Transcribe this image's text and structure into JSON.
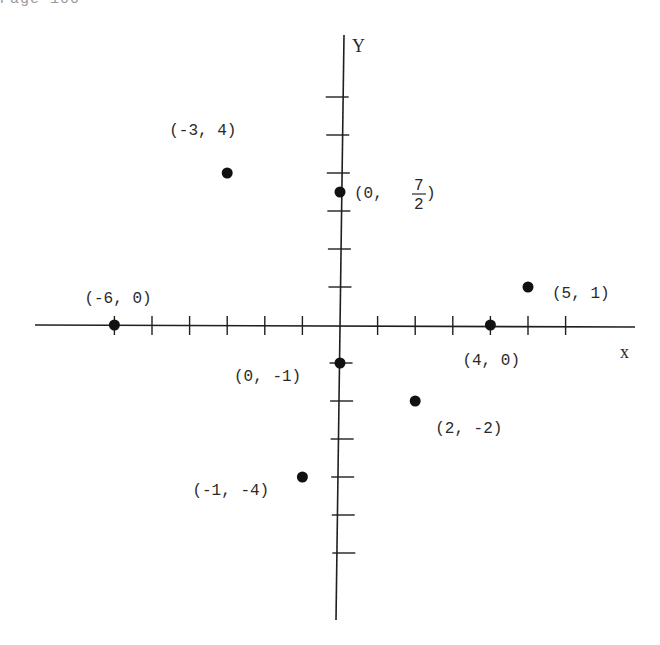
{
  "header": {
    "partial_text": "Page 100"
  },
  "chart_data": {
    "type": "scatter",
    "title": "",
    "xlabel": "x",
    "ylabel": "Y",
    "xlim": [
      -8,
      8
    ],
    "ylim": [
      -8,
      8
    ],
    "grid": false,
    "x_ticks": [
      -6,
      -5,
      -4,
      -3,
      -2,
      -1,
      1,
      2,
      3,
      4,
      5,
      6
    ],
    "y_ticks": [
      -6,
      -5,
      -4,
      -3,
      -2,
      -1,
      1,
      2,
      3,
      4,
      5,
      6
    ],
    "points": [
      {
        "x": -3,
        "y": 4,
        "label": "(-3, 4)"
      },
      {
        "x": 0,
        "y": 3.5,
        "label": "(0, 7/2)",
        "label_parts": {
          "prefix": "(0, ",
          "num": "7",
          "den": "2",
          "suffix": ")"
        }
      },
      {
        "x": -6,
        "y": 0,
        "label": "(-6, 0)"
      },
      {
        "x": 5,
        "y": 1,
        "label": "(5, 1)"
      },
      {
        "x": 4,
        "y": 0,
        "label": "(4, 0)"
      },
      {
        "x": 0,
        "y": -1,
        "label": "(0, -1)"
      },
      {
        "x": 2,
        "y": -2,
        "label": "(2, -2)"
      },
      {
        "x": -1,
        "y": -4,
        "label": "(-1, -4)"
      }
    ]
  },
  "layout": {
    "origin": [
      340,
      325
    ],
    "unit_x": 37.6,
    "unit_y": 38.0,
    "x_axis_range_px": [
      35,
      635
    ],
    "y_axis_range_px": [
      35,
      620
    ],
    "label_offsets": [
      [
        -58,
        -38,
        "start"
      ],
      [
        14,
        18,
        "start"
      ],
      [
        -30,
        -22,
        "start"
      ],
      [
        24,
        11,
        "start"
      ],
      [
        -28,
        40,
        "start"
      ],
      [
        -106,
        18,
        "start"
      ],
      [
        20,
        32,
        "start"
      ],
      [
        -110,
        18,
        "start"
      ]
    ]
  }
}
